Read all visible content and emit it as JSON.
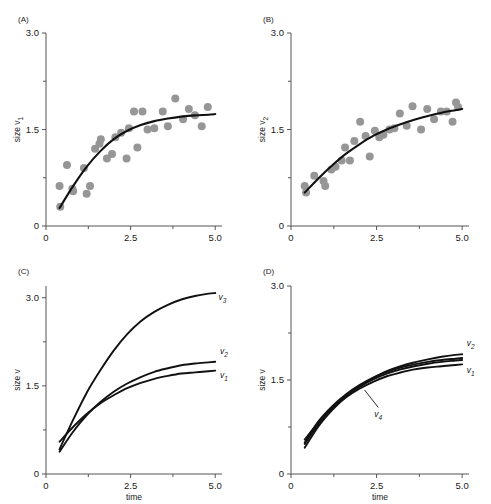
{
  "figure": {
    "panels": [
      {
        "id": "A",
        "label": "(A)",
        "ylabel": "size v",
        "ylabel_sub": "1",
        "xlabel": "",
        "yticks": [
          "0",
          "1.5",
          "3.0"
        ],
        "xticks": [
          "0",
          "2.5",
          "5.0"
        ]
      },
      {
        "id": "B",
        "label": "(B)",
        "ylabel": "size v",
        "ylabel_sub": "2",
        "xlabel": "",
        "yticks": [
          "0",
          "1.5",
          "3.0"
        ],
        "xticks": [
          "0",
          "2.5",
          "5.0"
        ]
      },
      {
        "id": "C",
        "label": "(C)",
        "ylabel": "size v",
        "ylabel_sub": "",
        "xlabel": "time",
        "yticks": [
          "0",
          "1.5",
          "3.0"
        ],
        "xticks": [
          "0",
          "2.5",
          "5.0"
        ]
      },
      {
        "id": "D",
        "label": "(D)",
        "ylabel": "size v",
        "ylabel_sub": "",
        "xlabel": "time",
        "yticks": [
          "0",
          "1.5",
          "3.0"
        ],
        "xticks": [
          "0",
          "2.5",
          "5.0"
        ]
      }
    ],
    "curve_labels": {
      "v1": "v",
      "v1_sub": "1",
      "v2": "v",
      "v2_sub": "2",
      "v3": "v",
      "v3_sub": "3",
      "v4": "v",
      "v4_sub": "4"
    },
    "colors": {
      "point": "#969696",
      "curve": "#111111",
      "axis": "#555555",
      "text": "#1a1a1a"
    }
  },
  "chart_data": [
    {
      "type": "scatter",
      "panel": "A",
      "title": "(A)",
      "xlabel": "",
      "ylabel": "size v1",
      "xlim": [
        0,
        5.2
      ],
      "ylim": [
        0,
        3.0
      ],
      "xticks": [
        0,
        2.5,
        5.0
      ],
      "yticks": [
        0,
        1.5,
        3.0
      ],
      "grid": false,
      "legend": "none",
      "series": [
        {
          "name": "observed v1",
          "kind": "points",
          "x": [
            0.4,
            0.42,
            0.62,
            0.78,
            0.8,
            1.12,
            1.2,
            1.3,
            1.45,
            1.58,
            1.62,
            1.8,
            1.95,
            2.05,
            2.22,
            2.38,
            2.45,
            2.6,
            2.7,
            2.85,
            3.0,
            3.2,
            3.45,
            3.6,
            3.82,
            4.05,
            4.22,
            4.4,
            4.6,
            4.78
          ],
          "y": [
            0.62,
            0.3,
            0.95,
            0.58,
            0.54,
            0.9,
            0.5,
            0.62,
            1.2,
            1.28,
            1.35,
            1.05,
            1.12,
            1.38,
            1.45,
            1.05,
            1.52,
            1.78,
            1.22,
            1.78,
            1.5,
            1.52,
            1.78,
            1.55,
            1.98,
            1.66,
            1.82,
            1.72,
            1.55,
            1.85
          ]
        },
        {
          "name": "fitted v1",
          "kind": "curve",
          "model": "saturating",
          "x": [
            0.4,
            0.8,
            1.2,
            1.6,
            2.0,
            2.4,
            2.8,
            3.2,
            3.6,
            4.0,
            4.4,
            4.8,
            5.0
          ],
          "y": [
            0.28,
            0.62,
            0.92,
            1.16,
            1.35,
            1.48,
            1.57,
            1.63,
            1.67,
            1.7,
            1.72,
            1.73,
            1.74
          ]
        }
      ]
    },
    {
      "type": "scatter",
      "panel": "B",
      "title": "(B)",
      "xlabel": "",
      "ylabel": "size v2",
      "xlim": [
        0,
        5.2
      ],
      "ylim": [
        0,
        3.0
      ],
      "xticks": [
        0,
        2.5,
        5.0
      ],
      "yticks": [
        0,
        1.5,
        3.0
      ],
      "grid": false,
      "legend": "none",
      "series": [
        {
          "name": "observed v2",
          "kind": "points",
          "x": [
            0.4,
            0.44,
            0.68,
            0.95,
            1.0,
            1.18,
            1.3,
            1.48,
            1.58,
            1.72,
            1.85,
            2.02,
            2.18,
            2.3,
            2.45,
            2.58,
            2.7,
            2.88,
            3.02,
            3.18,
            3.38,
            3.55,
            3.8,
            3.98,
            4.18,
            4.38,
            4.55,
            4.72,
            4.82,
            4.88
          ],
          "y": [
            0.62,
            0.52,
            0.78,
            0.7,
            0.62,
            0.88,
            0.92,
            1.02,
            1.22,
            1.02,
            1.32,
            1.62,
            1.4,
            1.08,
            1.48,
            1.38,
            1.42,
            1.5,
            1.52,
            1.75,
            1.56,
            1.86,
            1.5,
            1.82,
            1.66,
            1.78,
            1.78,
            1.62,
            1.92,
            1.85
          ]
        },
        {
          "name": "fitted v2",
          "kind": "curve",
          "model": "saturating",
          "x": [
            0.4,
            0.8,
            1.2,
            1.6,
            2.0,
            2.4,
            2.8,
            3.2,
            3.6,
            4.0,
            4.4,
            4.8,
            5.0
          ],
          "y": [
            0.52,
            0.74,
            0.94,
            1.12,
            1.27,
            1.4,
            1.5,
            1.58,
            1.65,
            1.71,
            1.76,
            1.8,
            1.82
          ]
        }
      ]
    },
    {
      "type": "line",
      "panel": "C",
      "title": "(C)",
      "xlabel": "time",
      "ylabel": "size v",
      "xlim": [
        0,
        5.2
      ],
      "ylim": [
        0,
        3.2
      ],
      "xticks": [
        0,
        2.5,
        5.0
      ],
      "yticks": [
        0,
        1.5,
        3.0
      ],
      "grid": false,
      "legend": "inline-right",
      "series": [
        {
          "name": "v1",
          "x": [
            0.4,
            0.8,
            1.2,
            1.6,
            2.0,
            2.4,
            2.8,
            3.2,
            3.6,
            4.0,
            4.4,
            4.8,
            5.0
          ],
          "y": [
            0.55,
            0.8,
            1.02,
            1.2,
            1.34,
            1.46,
            1.55,
            1.62,
            1.67,
            1.71,
            1.73,
            1.75,
            1.76
          ]
        },
        {
          "name": "v2",
          "x": [
            0.4,
            0.8,
            1.2,
            1.6,
            2.0,
            2.4,
            2.8,
            3.2,
            3.6,
            4.0,
            4.4,
            4.8,
            5.0
          ],
          "y": [
            0.38,
            0.72,
            1.0,
            1.22,
            1.4,
            1.54,
            1.65,
            1.74,
            1.8,
            1.85,
            1.88,
            1.9,
            1.91
          ]
        },
        {
          "name": "v3",
          "x": [
            0.4,
            0.8,
            1.2,
            1.6,
            2.0,
            2.4,
            2.8,
            3.2,
            3.6,
            4.0,
            4.4,
            4.8,
            5.0
          ],
          "y": [
            0.42,
            0.92,
            1.38,
            1.76,
            2.1,
            2.38,
            2.6,
            2.76,
            2.88,
            2.97,
            3.03,
            3.07,
            3.08
          ]
        }
      ]
    },
    {
      "type": "line",
      "panel": "D",
      "title": "(D)",
      "xlabel": "time",
      "ylabel": "size v",
      "xlim": [
        0,
        5.2
      ],
      "ylim": [
        0,
        3.0
      ],
      "xticks": [
        0,
        2.5,
        5.0
      ],
      "yticks": [
        0,
        1.5,
        3.0
      ],
      "grid": false,
      "legend": "inline-right",
      "annotations": [
        {
          "text": "v4",
          "x": 2.55,
          "y": 0.95,
          "leader_to_x": 2.15,
          "leader_to_y": 1.34
        }
      ],
      "series": [
        {
          "name": "v1",
          "x": [
            0.4,
            0.8,
            1.2,
            1.6,
            2.0,
            2.4,
            2.8,
            3.2,
            3.6,
            4.0,
            4.4,
            4.8,
            5.0
          ],
          "y": [
            0.55,
            0.82,
            1.04,
            1.22,
            1.36,
            1.47,
            1.56,
            1.62,
            1.67,
            1.7,
            1.72,
            1.74,
            1.75
          ]
        },
        {
          "name": "v2",
          "x": [
            0.4,
            0.8,
            1.2,
            1.6,
            2.0,
            2.4,
            2.8,
            3.2,
            3.6,
            4.0,
            4.4,
            4.8,
            5.0
          ],
          "y": [
            0.42,
            0.76,
            1.02,
            1.23,
            1.4,
            1.53,
            1.64,
            1.72,
            1.78,
            1.83,
            1.87,
            1.9,
            1.91
          ]
        },
        {
          "name": "v3",
          "x": [
            0.4,
            0.8,
            1.2,
            1.6,
            2.0,
            2.4,
            2.8,
            3.2,
            3.6,
            4.0,
            4.4,
            4.8,
            5.0
          ],
          "y": [
            0.48,
            0.8,
            1.05,
            1.24,
            1.39,
            1.51,
            1.6,
            1.67,
            1.72,
            1.76,
            1.79,
            1.81,
            1.82
          ]
        },
        {
          "name": "v4",
          "x": [
            0.4,
            0.8,
            1.2,
            1.6,
            2.0,
            2.4,
            2.8,
            3.2,
            3.6,
            4.0,
            4.4,
            4.8,
            5.0
          ],
          "y": [
            0.5,
            0.84,
            1.08,
            1.27,
            1.42,
            1.54,
            1.63,
            1.7,
            1.75,
            1.79,
            1.82,
            1.84,
            1.85
          ]
        }
      ]
    }
  ]
}
